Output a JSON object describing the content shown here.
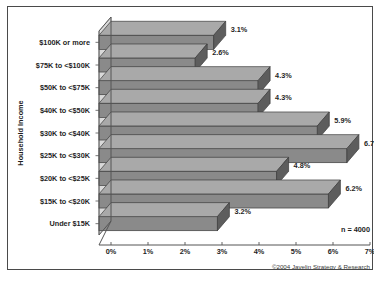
{
  "figure": {
    "border_color": "#4a4a4a",
    "background": "#ffffff"
  },
  "annotations": {
    "sample_note": "n = 4000",
    "copyright": "©2004 Javelin Strategy & Research"
  },
  "chart_data": {
    "type": "bar",
    "orientation": "horizontal",
    "style": "3d",
    "title": "",
    "xlabel": "",
    "ylabel": "Household Income",
    "categories": [
      "$100K or more",
      "$75K to <$100K",
      "$50K to <$75K",
      "$40K to <$50K",
      "$30K to <$40K",
      "$25K to <$30K",
      "$20K to <$25K",
      "$15K to <$20K",
      "Under $15K"
    ],
    "values": [
      3.1,
      2.6,
      4.3,
      4.3,
      5.9,
      6.7,
      4.8,
      6.2,
      3.2
    ],
    "value_labels": [
      "3.1%",
      "2.6%",
      "4.3%",
      "4.3%",
      "5.9%",
      "6.7%",
      "4.8%",
      "6.2%",
      "3.2%"
    ],
    "xlim": [
      0,
      7
    ],
    "xticks": [
      0,
      1,
      2,
      3,
      4,
      5,
      6,
      7
    ],
    "xtick_labels": [
      "0%",
      "1%",
      "2%",
      "3%",
      "4%",
      "5%",
      "6%",
      "7%"
    ],
    "grid": false,
    "legend": null,
    "bar_face_color": "#8a8a8a",
    "bar_top_color": "#a9a9a9",
    "bar_side_color": "#5d5d5d",
    "wall_color": "#d9d9d9",
    "axis_color": "#555555"
  }
}
